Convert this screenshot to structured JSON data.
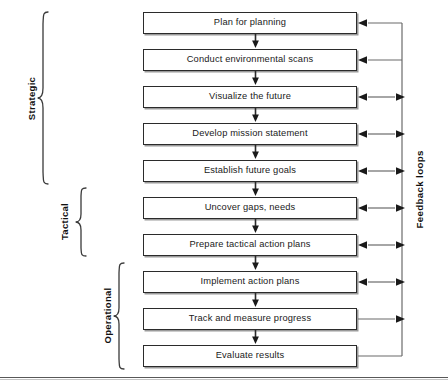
{
  "diagram": {
    "background_color": "#ffffff",
    "line_color": "#2b2b2b",
    "text_color": "#1a1a1a",
    "steps": [
      {
        "id": "step-1",
        "label": "Plan for planning",
        "group": "Strategic",
        "feedback_connector": "arrow-left"
      },
      {
        "id": "step-2",
        "label": "Conduct environmental scans",
        "group": "Strategic",
        "feedback_connector": "arrow-left"
      },
      {
        "id": "step-3",
        "label": "Visualize the future",
        "group": "Strategic",
        "feedback_connector": "arrow-both"
      },
      {
        "id": "step-4",
        "label": "Develop mission statement",
        "group": "Strategic",
        "feedback_connector": "arrow-both"
      },
      {
        "id": "step-5",
        "label": "Establish future goals",
        "group": "Strategic",
        "feedback_connector": "arrow-both"
      },
      {
        "id": "step-6",
        "label": "Uncover gaps, needs",
        "group": "Tactical",
        "feedback_connector": "arrow-both"
      },
      {
        "id": "step-7",
        "label": "Prepare tactical action plans",
        "group": "Tactical",
        "feedback_connector": "arrow-both"
      },
      {
        "id": "step-8",
        "label": "Implement action plans",
        "group": "Operational",
        "feedback_connector": "arrow-both"
      },
      {
        "id": "step-9",
        "label": "Track and measure progress",
        "group": "Operational",
        "feedback_connector": "arrow-right"
      },
      {
        "id": "step-10",
        "label": "Evaluate results",
        "group": "Operational",
        "feedback_connector": "plain-line"
      }
    ],
    "groups": [
      {
        "id": "group-strategic",
        "label": "Strategic",
        "first_step": 1,
        "last_step": 5
      },
      {
        "id": "group-tactical",
        "label": "Tactical",
        "first_step": 6,
        "last_step": 7
      },
      {
        "id": "group-operational",
        "label": "Operational",
        "first_step": 8,
        "last_step": 10
      }
    ],
    "feedback": {
      "label": "Feedback loops",
      "bus_description": "vertical line on right linking every step back to the top two steps"
    }
  }
}
